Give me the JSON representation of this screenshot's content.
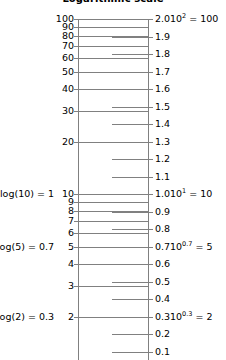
{
  "title": "Logarithmic scale",
  "colors": {
    "line": "#808080",
    "text": "#000000",
    "background": "#ffffff"
  },
  "chart_data": {
    "type": "line",
    "title": "Logarithmic scale",
    "xlabel": "",
    "ylabel": "",
    "grid": true,
    "legend_position": "none",
    "left_axis": {
      "name": "logarithmic",
      "scale": "log",
      "ylim": [
        1.2589,
        100
      ],
      "tick_values": [
        100,
        90,
        80,
        70,
        60,
        50,
        40,
        30,
        20,
        10,
        9,
        8,
        7,
        6,
        5,
        4,
        3,
        2
      ],
      "tick_labels": [
        "100",
        "90",
        "80",
        "70",
        "60",
        "50",
        "40",
        "30",
        "20",
        "10",
        "9",
        "8",
        "7",
        "6",
        "5",
        "4",
        "3",
        "2"
      ]
    },
    "right_axis": {
      "name": "linear",
      "scale": "linear",
      "ylim": [
        0.1,
        2.0
      ],
      "tick_values": [
        2.0,
        1.9,
        1.8,
        1.7,
        1.6,
        1.5,
        1.4,
        1.3,
        1.2,
        1.1,
        1.0,
        0.9,
        0.8,
        0.7,
        0.6,
        0.5,
        0.4,
        0.3,
        0.2,
        0.1
      ],
      "tick_labels": [
        "2.0",
        "1.9",
        "1.8",
        "1.7",
        "1.6",
        "1.5",
        "1.4",
        "1.3",
        "1.2",
        "1.1",
        "1.0",
        "0.9",
        "0.8",
        "0.7",
        "0.6",
        "0.5",
        "0.4",
        "0.3",
        "0.2",
        "0.1"
      ]
    },
    "annotations_left": [
      {
        "text": "log(10) = 1",
        "at_log_value": 10,
        "at_linear_value": 1.0
      },
      {
        "text": "log(5) = 0.7",
        "at_log_value": 5,
        "at_linear_value": 0.7
      },
      {
        "text": "log(2) = 0.3",
        "at_log_value": 2,
        "at_linear_value": 0.3
      }
    ],
    "annotations_right": [
      {
        "base": "10",
        "exponent": "2",
        "equals": "= 100",
        "at_linear_value": 2.0
      },
      {
        "base": "10",
        "exponent": "1",
        "equals": "= 10",
        "at_linear_value": 1.0
      },
      {
        "base": "10",
        "exponent": "0.7",
        "equals": "= 5",
        "at_linear_value": 0.7
      },
      {
        "base": "10",
        "exponent": "0.3",
        "equals": "= 2",
        "at_linear_value": 0.3
      }
    ]
  },
  "geometry": {
    "top_y": 19,
    "bottom_y": 352,
    "top_linear": 2.0,
    "bottom_linear": 0.1
  }
}
